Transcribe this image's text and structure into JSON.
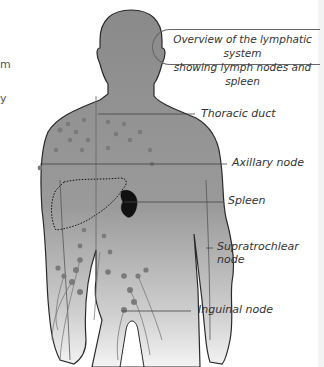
{
  "title": {
    "line1": "Overview of the lymphatic system",
    "line2": "showing lymph nodes and spleen"
  },
  "left_edge_fragments": [
    "m",
    "y"
  ],
  "labels": [
    {
      "id": "thoracic-duct",
      "text": "Thoracic duct"
    },
    {
      "id": "axillary-node",
      "text": "Axillary node"
    },
    {
      "id": "spleen",
      "text": "Spleen"
    },
    {
      "id": "supratrochlear-node",
      "line1": "Supratrochlear",
      "line2": "node"
    },
    {
      "id": "inguinal-node",
      "text": "Inguinal node"
    }
  ],
  "colors": {
    "body": "#8c8c8c",
    "body_light": "#d6d6d6",
    "outline": "#2a2a2a",
    "nodes": "#777777",
    "spleen": "#111111",
    "leader": "#444444"
  }
}
